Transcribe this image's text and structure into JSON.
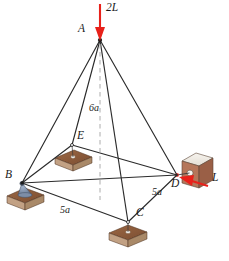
{
  "figure": {
    "type": "space-truss-free-body-diagram",
    "background_color": "#ffffff",
    "member_color": "#2b2b2b",
    "dashed_color": "#9a9a9a",
    "force_color": "#e8211a",
    "pad_top_color": "#8a5a3c",
    "pad_side_color": "#c9a98e",
    "block_top_color": "#f0ece6",
    "block_face_color": "#b5765a",
    "ball_color": "#6d7f9c"
  },
  "nodes": [
    {
      "id": "A",
      "label": "A",
      "x": 100,
      "y": 40,
      "label_x": 80,
      "label_y": 28,
      "support": "none"
    },
    {
      "id": "B",
      "label": "B",
      "x": 22,
      "y": 183,
      "label_x": 7,
      "label_y": 174,
      "support": "ball-on-pad"
    },
    {
      "id": "C",
      "label": "C",
      "x": 128,
      "y": 222,
      "label_x": 137,
      "label_y": 212,
      "support": "ball-on-pad"
    },
    {
      "id": "D",
      "label": "D",
      "x": 177,
      "y": 175,
      "label_x": 173,
      "label_y": 180,
      "support": "ball-and-socket-block"
    },
    {
      "id": "E",
      "label": "E",
      "x": 72,
      "y": 145,
      "label_x": 78,
      "label_y": 133,
      "support": "ball-on-pad"
    }
  ],
  "members": [
    {
      "from": "A",
      "to": "B"
    },
    {
      "from": "A",
      "to": "C"
    },
    {
      "from": "A",
      "to": "D"
    },
    {
      "from": "A",
      "to": "E"
    },
    {
      "from": "B",
      "to": "C"
    },
    {
      "from": "B",
      "to": "D"
    },
    {
      "from": "B",
      "to": "E"
    },
    {
      "from": "C",
      "to": "D"
    },
    {
      "from": "E",
      "to": "D"
    }
  ],
  "centerline": {
    "name": "vertical-centerline",
    "from_x": 100,
    "from_y": 40,
    "to_x": 100,
    "to_y": 200,
    "style": "dashed"
  },
  "dimensions": [
    {
      "id": "height",
      "label": "6a",
      "x": 92,
      "y": 108,
      "describes": "A to base vertical height"
    },
    {
      "id": "span-bc",
      "label": "5a",
      "x": 63,
      "y": 210,
      "describes": "B to C base edge"
    },
    {
      "id": "span-cd",
      "label": "5a",
      "x": 155,
      "y": 192,
      "describes": "C to D base edge"
    }
  ],
  "forces": [
    {
      "id": "load-2L",
      "label": "2L",
      "label_x": 105,
      "label_y": 5,
      "tail_x": 100,
      "tail_y": 4,
      "tip_x": 100,
      "tip_y": 38,
      "applied_at": "A",
      "direction": "downward-vertical",
      "color": "#e8211a"
    },
    {
      "id": "load-L",
      "label": "L",
      "label_x": 213,
      "label_y": 178,
      "tail_x": 208,
      "tail_y": 186,
      "tip_x": 181,
      "tip_y": 177,
      "applied_at": "D",
      "direction": "toward-D-from-right",
      "color": "#e8211a"
    }
  ],
  "caption": ""
}
